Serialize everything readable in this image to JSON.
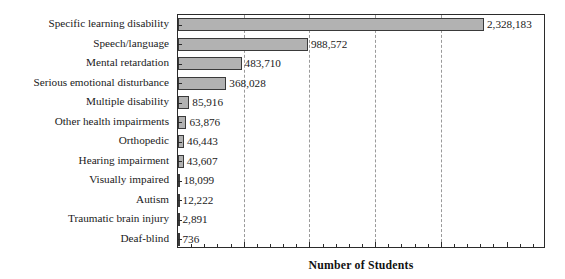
{
  "chart_data": {
    "type": "bar",
    "orientation": "horizontal",
    "title": "",
    "xlabel": "Number of Students",
    "ylabel": "",
    "xlim": [
      0,
      2800000
    ],
    "grid": true,
    "gridlines": [
      500000,
      1000000,
      1500000,
      2000000
    ],
    "legend": "none",
    "categories": [
      "Specific learning disability",
      "Speech/language",
      "Mental retardation",
      "Serious emotional disturbance",
      "Multiple disability",
      "Other health impairments",
      "Orthopedic",
      "Hearing impairment",
      "Visually impaired",
      "Autism",
      "Traumatic brain injury",
      "Deaf-blind"
    ],
    "values": [
      2328183,
      988572,
      483710,
      368028,
      85916,
      63876,
      46443,
      43607,
      18099,
      12222,
      2891,
      736
    ],
    "value_labels": [
      "2,328,183",
      "988,572",
      "483,710",
      "368,028",
      "85,916",
      "63,876",
      "46,443",
      "43,607",
      "18,099",
      "12,222",
      "2,891",
      "736"
    ],
    "bar_color": "#b2b2b2",
    "bar_edge_color": "#3a3a3a",
    "axis_color": "#2b2b2b",
    "grid_color": "#9a9a9a"
  }
}
